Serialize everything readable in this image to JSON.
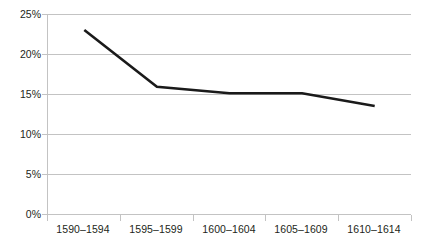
{
  "chart_data": {
    "type": "line",
    "title": "",
    "subtitle": "",
    "xlabel": "",
    "ylabel": "",
    "categories": [
      "1590–1594",
      "1595–1599",
      "1600–1604",
      "1605–1609",
      "1610–1614"
    ],
    "series": [
      {
        "name": "",
        "values": [
          23.0,
          15.9,
          15.1,
          15.1,
          13.5
        ]
      }
    ],
    "value_unit": "%",
    "ylim": [
      0,
      25
    ],
    "ytick_values": [
      0,
      5,
      10,
      15,
      20,
      25
    ],
    "ytick_labels": [
      "0%",
      "5%",
      "10%",
      "15%",
      "20%",
      "25%"
    ],
    "grid": true,
    "grid_axis": "y",
    "legend": false,
    "legend_position": "none",
    "markers": false,
    "line_color": "#1a1a1a",
    "grid_color": "#c3c3c3",
    "axis_color": "#c3c3c3",
    "text_color": "#231f20",
    "background_color": "#ffffff"
  }
}
